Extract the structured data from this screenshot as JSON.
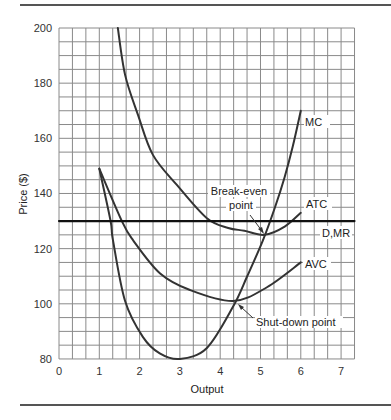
{
  "chart_data": {
    "type": "line",
    "title": "",
    "xlabel": "Output",
    "ylabel": "Price ($)",
    "xlim": [
      0,
      7.333
    ],
    "ylim": [
      80,
      200
    ],
    "x_ticks": [
      0,
      1,
      2,
      3,
      4,
      5,
      6,
      7
    ],
    "y_ticks": [
      80,
      100,
      120,
      140,
      160,
      180,
      200
    ],
    "grid": {
      "on": true,
      "x_step": 0.3333,
      "y_step": 5
    },
    "series": [
      {
        "name": "MC",
        "x": [
          1,
          1.28,
          1.34,
          1.64,
          2.08,
          2.5,
          3,
          3.67,
          4.32,
          4.67,
          5.06,
          5.36,
          5.6,
          5.8,
          6
        ],
        "values": [
          149,
          130,
          123,
          101,
          88,
          82,
          80,
          84,
          99,
          110,
          123,
          135,
          146,
          157,
          170
        ]
      },
      {
        "name": "ATC",
        "x": [
          1.46,
          1.64,
          1.96,
          2.33,
          2.93,
          3.67,
          4.2,
          4.6,
          5.1,
          5.6,
          6
        ],
        "values": [
          200,
          183,
          168.5,
          154,
          143,
          131,
          127.5,
          126.5,
          125,
          128,
          133
        ]
      },
      {
        "name": "AVC",
        "x": [
          1,
          1.56,
          1.84,
          2.51,
          3.25,
          4.32,
          5.16,
          6
        ],
        "values": [
          149,
          130,
          123,
          111,
          105,
          101,
          106,
          115
        ]
      },
      {
        "name": "D,MR",
        "x": [
          0,
          7.333
        ],
        "values": [
          130,
          130
        ]
      }
    ],
    "annotations": [
      {
        "text": "Break-even point",
        "points_to": [
          5.1,
          125
        ]
      },
      {
        "text": "Shut-down point",
        "points_to": [
          4.32,
          101
        ]
      }
    ],
    "legend_position": "inline-labels"
  },
  "labels": {
    "mc": "MC",
    "atc": "ATC",
    "dmr": "D,MR",
    "avc": "AVC",
    "break_even_1": "Break-even",
    "break_even_2": "point",
    "shutdown": "Shut-down point",
    "xlabel": "Output",
    "ylabel": "Price ($)"
  },
  "colors": {
    "curve": "#333333",
    "grid": "#8a8a8a",
    "rule": "#555555"
  }
}
